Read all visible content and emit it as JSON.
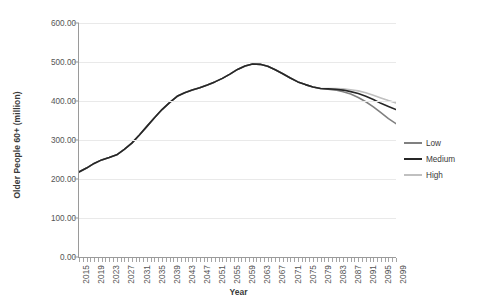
{
  "chart_data": {
    "type": "line",
    "title": "",
    "xlabel": "Year",
    "ylabel": "Older People 60+ (million)",
    "ylim": [
      0,
      600
    ],
    "ytick_values": [
      0,
      100,
      200,
      300,
      400,
      500,
      600
    ],
    "ytick_labels": [
      "0.00",
      "100.00",
      "200.00",
      "300.00",
      "400.00",
      "500.00",
      "600.00"
    ],
    "xlim": [
      2015,
      2099
    ],
    "xtick_labels": [
      "2015",
      "2019",
      "2023",
      "2027",
      "2031",
      "2035",
      "2039",
      "2043",
      "2047",
      "2051",
      "2055",
      "2059",
      "2063",
      "2067",
      "2071",
      "2075",
      "2079",
      "2083",
      "2087",
      "2091",
      "2095",
      "2099"
    ],
    "xtick_step": 4,
    "minor_tick_step": 1,
    "grid": "horizontal",
    "legend_position": "right",
    "x": [
      2015,
      2017,
      2019,
      2021,
      2023,
      2025,
      2027,
      2029,
      2031,
      2033,
      2035,
      2037,
      2039,
      2041,
      2043,
      2045,
      2047,
      2049,
      2051,
      2053,
      2055,
      2057,
      2059,
      2061,
      2063,
      2065,
      2067,
      2069,
      2071,
      2073,
      2075,
      2077,
      2079,
      2081,
      2083,
      2085,
      2087,
      2089,
      2091,
      2093,
      2095,
      2097,
      2099
    ],
    "series": [
      {
        "name": "Low",
        "color": "#808080",
        "values": [
          218,
          228,
          240,
          249,
          255,
          262,
          276,
          292,
          313,
          335,
          357,
          378,
          396,
          412,
          421,
          428,
          434,
          441,
          449,
          458,
          469,
          481,
          490,
          495,
          494,
          489,
          480,
          470,
          459,
          449,
          442,
          436,
          432,
          430,
          428,
          424,
          418,
          409,
          398,
          385,
          370,
          355,
          342
        ]
      },
      {
        "name": "Medium",
        "color": "#262626",
        "values": [
          218,
          228,
          240,
          249,
          255,
          262,
          276,
          292,
          313,
          335,
          357,
          378,
          396,
          412,
          421,
          428,
          434,
          441,
          449,
          458,
          469,
          481,
          490,
          495,
          494,
          489,
          480,
          470,
          459,
          449,
          442,
          436,
          432,
          431,
          430,
          428,
          424,
          419,
          412,
          404,
          394,
          386,
          378
        ]
      },
      {
        "name": "High",
        "color": "#c0c0c0",
        "values": [
          218,
          228,
          240,
          249,
          255,
          262,
          276,
          292,
          313,
          335,
          357,
          378,
          396,
          412,
          421,
          428,
          434,
          441,
          449,
          458,
          469,
          481,
          490,
          495,
          494,
          489,
          480,
          470,
          459,
          449,
          442,
          436,
          432,
          432,
          432,
          431,
          429,
          426,
          421,
          415,
          408,
          401,
          395
        ]
      }
    ]
  },
  "legend": {
    "items": [
      {
        "label": "Low"
      },
      {
        "label": "Medium"
      },
      {
        "label": "High"
      }
    ]
  }
}
